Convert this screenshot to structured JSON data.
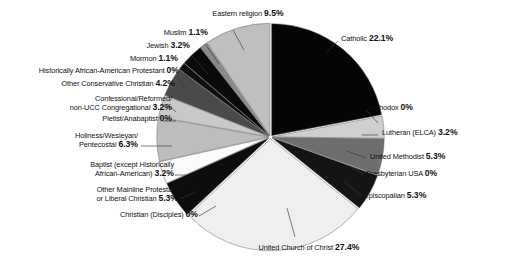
{
  "chart_data": {
    "type": "pie",
    "title": "",
    "subtitle": "",
    "xlabel": "",
    "ylabel": "",
    "grid": false,
    "legend_position": "callout-labels",
    "units": "percent",
    "start_angle_deg": 0,
    "direction": "clockwise",
    "categories": [
      "Catholic",
      "Orthodox",
      "Lutheran (ELCA)",
      "United Methodist",
      "Presbyterian USA",
      "Episcopalian",
      "United Church of Christ",
      "Christian (Disciples)",
      "Other Mainline Protestant or Liberal Christian",
      "Baptist (except Historically African-American)",
      "Holiness/Wesleyan/ Pentecostal",
      "Pietist/Anabaptist",
      "Confessional/Reformed/ non-UCC Congregational",
      "Other Conservative Christian",
      "Historically African-American Protestant",
      "Mormon",
      "Jewish",
      "Muslim",
      "Eastern religion"
    ],
    "values": [
      22.1,
      0,
      3.2,
      5.3,
      0,
      5.3,
      27.4,
      0,
      5.3,
      3.2,
      6.3,
      0,
      3.2,
      4.2,
      0,
      1.1,
      3.2,
      1.1,
      9.5
    ],
    "colors": [
      "#050505",
      "#f2f2f2",
      "#cfcfcf",
      "#6e6e6e",
      "#f2f2f2",
      "#141414",
      "#efefef",
      "#ffffff",
      "#0d0d0d",
      "#fbfbfb",
      "#bdbdbd",
      "#f7f7f7",
      "#c9c9c9",
      "#4a4a4a",
      "#e8e8e8",
      "#101010",
      "#0a0a0a",
      "#8a8a8a",
      "#bfbfbf"
    ],
    "slices": [
      {
        "label": "Catholic",
        "value": 22.1,
        "value_text": "22.1%",
        "color": "#050505"
      },
      {
        "label": "Orthodox",
        "value": 0,
        "value_text": "0%",
        "color": "#f2f2f2"
      },
      {
        "label": "Lutheran (ELCA)",
        "value": 3.2,
        "value_text": "3.2%",
        "color": "#cfcfcf"
      },
      {
        "label": "United Methodist",
        "value": 5.3,
        "value_text": "5.3%",
        "color": "#6e6e6e"
      },
      {
        "label": "Presbyterian USA",
        "value": 0,
        "value_text": "0%",
        "color": "#f2f2f2"
      },
      {
        "label": "Episcopalian",
        "value": 5.3,
        "value_text": "5.3%",
        "color": "#141414"
      },
      {
        "label": "United Church of Christ",
        "value": 27.4,
        "value_text": "27.4%",
        "color": "#efefef"
      },
      {
        "label": "Christian (Disciples)",
        "value": 0,
        "value_text": "0%",
        "color": "#ffffff"
      },
      {
        "label": "Other Mainline Protestant or Liberal Christian",
        "value": 5.3,
        "value_text": "5.3%",
        "color": "#0d0d0d"
      },
      {
        "label": "Baptist (except Historically African-American)",
        "value": 3.2,
        "value_text": "3.2%",
        "color": "#fbfbfb"
      },
      {
        "label": "Holiness/Wesleyan/ Pentecostal",
        "value": 6.3,
        "value_text": "6.3%",
        "color": "#bdbdbd"
      },
      {
        "label": "Pietist/Anabaptist",
        "value": 0,
        "value_text": "0%",
        "color": "#f7f7f7"
      },
      {
        "label": "Confessional/Reformed/ non-UCC Congregational",
        "value": 3.2,
        "value_text": "3.2%",
        "color": "#c9c9c9"
      },
      {
        "label": "Other Conservative Christian",
        "value": 4.2,
        "value_text": "4.2%",
        "color": "#4a4a4a"
      },
      {
        "label": "Historically African-American Protestant",
        "value": 0,
        "value_text": "0%",
        "color": "#e8e8e8"
      },
      {
        "label": "Mormon",
        "value": 1.1,
        "value_text": "1.1%",
        "color": "#101010"
      },
      {
        "label": "Jewish",
        "value": 3.2,
        "value_text": "3.2%",
        "color": "#0a0a0a"
      },
      {
        "label": "Muslim",
        "value": 1.1,
        "value_text": "1.1%",
        "color": "#8a8a8a"
      },
      {
        "label": "Eastern religion",
        "value": 9.5,
        "value_text": "9.5%",
        "color": "#bfbfbf"
      }
    ]
  },
  "callouts": {
    "eastern_religion": {
      "name": "Eastern religion",
      "pct": "9.5%"
    },
    "muslim": {
      "name": "Muslim",
      "pct": "1.1%"
    },
    "jewish": {
      "name": "Jewish",
      "pct": "3.2%"
    },
    "mormon": {
      "name": "Mormon",
      "pct": "1.1%"
    },
    "hist_aa_protestant": {
      "name": "Historically  African-American Protestant",
      "pct": "0%"
    },
    "other_conservative": {
      "name": "Other Conservative Christian",
      "pct": "4.2%"
    },
    "confessional_line1": "Confessional/Reformed/",
    "confessional_line2": "non-UCC Congregational",
    "confessional_pct": "3.2%",
    "pietist": {
      "name": "Pietist/Anabaptist",
      "pct": "0%"
    },
    "holiness_line1": "Holiness/Wesleyan/",
    "holiness_line2": "Pentecostal",
    "holiness_pct": "6.3%",
    "baptist_line1": "Baptist (except Historically",
    "baptist_line2": "African-American)",
    "baptist_pct": "3.2%",
    "other_mainline_line1": "Other Mainline Protestant",
    "other_mainline_line2": "or Liberal Christian",
    "other_mainline_pct": "5.3%",
    "disciples": {
      "name": "Christian (Disciples)",
      "pct": "0%"
    },
    "ucc": {
      "name": "United Church of Christ",
      "pct": "27.4%"
    },
    "catholic": {
      "name": "Catholic",
      "pct": "22.1%"
    },
    "orthodox": {
      "name": "Orthodox",
      "pct": "0%"
    },
    "lutheran": {
      "name": "Lutheran (ELCA)",
      "pct": "3.2%"
    },
    "methodist": {
      "name": "United Methodist",
      "pct": "5.3%"
    },
    "presbyterian": {
      "name": "Presbyterian USA",
      "pct": "0%"
    },
    "episcopalian": {
      "name": "Episcopalian",
      "pct": "5.3%"
    }
  }
}
